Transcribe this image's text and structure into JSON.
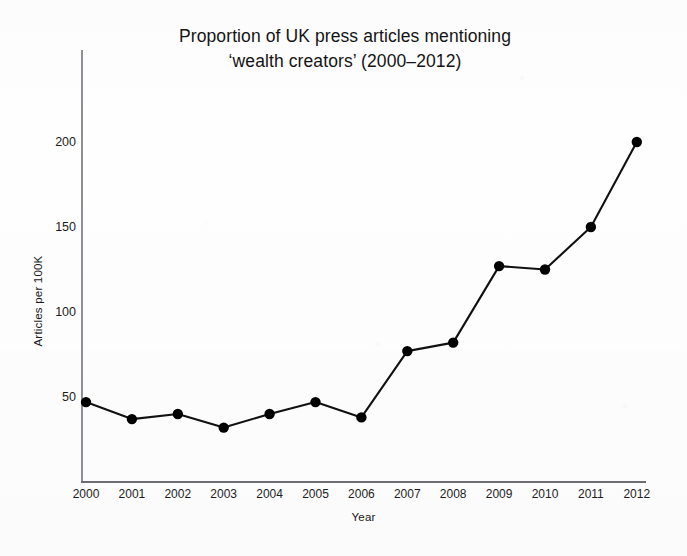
{
  "chart_data": {
    "type": "line",
    "title_lines": [
      "Proportion of UK press articles mentioning",
      "‘wealth creators’ (2000–2012)"
    ],
    "xlabel": "Year",
    "ylabel": "Articles per 100K",
    "categories": [
      "2000",
      "2001",
      "2002",
      "2003",
      "2004",
      "2005",
      "2006",
      "2007",
      "2008",
      "2009",
      "2010",
      "2011",
      "2012"
    ],
    "x": [
      2000,
      2001,
      2002,
      2003,
      2004,
      2005,
      2006,
      2007,
      2008,
      2009,
      2010,
      2011,
      2012
    ],
    "values": [
      47,
      37,
      40,
      32,
      40,
      47,
      38,
      77,
      82,
      127,
      125,
      150,
      200
    ],
    "series": [
      {
        "name": "Articles per 100K mentioning 'wealth creators'",
        "values": [
          47,
          37,
          40,
          32,
          40,
          47,
          38,
          77,
          82,
          127,
          125,
          150,
          200
        ]
      }
    ],
    "ylim": [
      0,
      215
    ],
    "xlim": [
      2000,
      2012
    ],
    "y_ticks": [
      50,
      100,
      150,
      200
    ],
    "y_tick_labels": [
      "50",
      "100",
      "150",
      "200"
    ],
    "x_ticks": [
      2000,
      2001,
      2002,
      2003,
      2004,
      2005,
      2006,
      2007,
      2008,
      2009,
      2010,
      2011,
      2012
    ],
    "grid": false,
    "legend": false,
    "legend_position": "none",
    "marker": "filled-circle",
    "line_color": "#111111",
    "marker_color": "#000000",
    "axis_color": "#7b7d82",
    "background_color": "#fefefe",
    "annotations": []
  }
}
